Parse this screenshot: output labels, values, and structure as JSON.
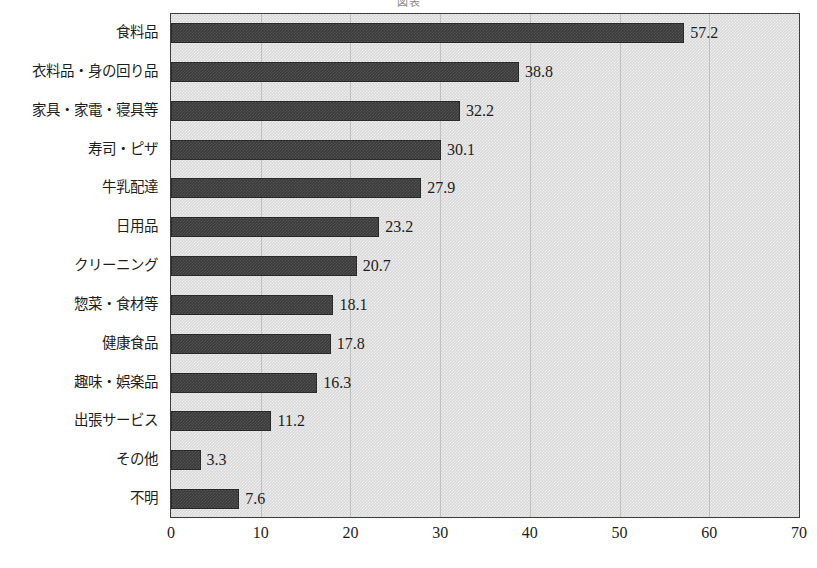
{
  "chart_data": {
    "type": "bar",
    "orientation": "horizontal",
    "title": "図表",
    "xlabel": "",
    "ylabel": "",
    "xlim": [
      0,
      70
    ],
    "xticks": [
      "0",
      "10",
      "20",
      "30",
      "40",
      "50",
      "60",
      "70"
    ],
    "grid": true,
    "legend": false,
    "bar_color": "#3b3b3b",
    "plot_background": "#d9d9d9",
    "categories": [
      "食料品",
      "衣料品・身の回り品",
      "家具・家電・寝具等",
      "寿司・ピザ",
      "牛乳配達",
      "日用品",
      "クリーニング",
      "惣菜・食材等",
      "健康食品",
      "趣味・娯楽品",
      "出張サービス",
      "その他",
      "不明"
    ],
    "values": [
      57.2,
      38.8,
      32.2,
      30.1,
      27.9,
      23.2,
      20.7,
      18.1,
      17.8,
      16.3,
      11.2,
      3.3,
      7.6
    ],
    "value_labels": [
      "57.2",
      "38.8",
      "32.2",
      "30.1",
      "27.9",
      "23.2",
      "20.7",
      "18.1",
      "17.8",
      "16.3",
      "11.2",
      "3.3",
      "7.6"
    ]
  }
}
